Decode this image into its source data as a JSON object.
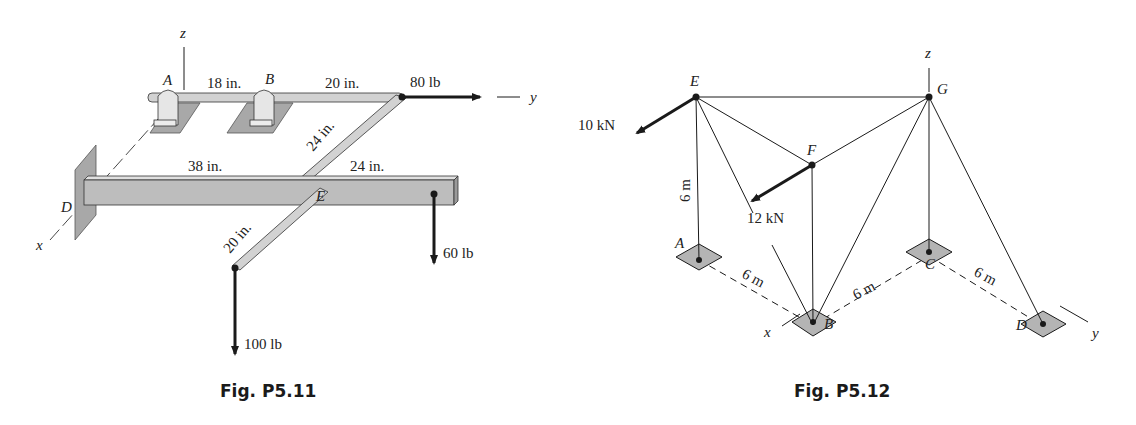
{
  "figures": [
    {
      "id": "P5.11",
      "caption": "Fig. P5.11",
      "axes": {
        "x": "x",
        "y": "y",
        "z": "z"
      },
      "points": {
        "A": "A",
        "B": "B",
        "D": "D",
        "E": "E"
      },
      "dimensions": {
        "AB": "18 in.",
        "B_to_corner": "20 in.",
        "diagonal": "24 in.",
        "D_to_E": "38 in.",
        "E_to_end": "24 in.",
        "E_to_load": "20 in."
      },
      "forces": {
        "horizontal": "80 lb",
        "end_down": "60 lb",
        "arm_down": "100 lb"
      }
    },
    {
      "id": "P5.12",
      "caption": "Fig. P5.12",
      "axes": {
        "x": "x",
        "y": "y",
        "z": "z"
      },
      "points": {
        "A": "A",
        "B": "B",
        "C": "C",
        "D": "D",
        "E": "E",
        "F": "F",
        "G": "G"
      },
      "dimensions": {
        "height": "6 m",
        "AB": "6 m",
        "BC": "6 m",
        "CD": "6 m"
      },
      "forces": {
        "at_E": "10 kN",
        "at_F": "12 kN"
      }
    }
  ],
  "colors": {
    "ink": "#1a1a1a",
    "member_fill": "#d2d2d2",
    "plate_fill": "#a8a8a8",
    "support_fill": "#b4b4b4"
  }
}
